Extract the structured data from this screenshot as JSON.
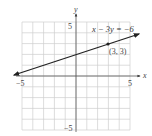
{
  "chart_data": {
    "type": "line",
    "title": "",
    "xlabel": "x",
    "ylabel": "y",
    "xlim": [
      -5,
      5
    ],
    "ylim": [
      -5,
      5
    ],
    "grid": true,
    "x_ticks_labeled": [
      "-5",
      "5"
    ],
    "y_ticks_labeled": [
      "5",
      "-5"
    ],
    "series": [
      {
        "name": "x - 3y = -6",
        "equation": "x − 3y = −6",
        "x": [
          -5.7,
          5.7
        ],
        "y": [
          0.1,
          3.9
        ],
        "arrows": "both"
      }
    ],
    "points": [
      {
        "x": 3,
        "y": 3,
        "label": "(3, 3)"
      }
    ],
    "annotations": [
      {
        "text": "x − 3y = −6",
        "x": 1.8,
        "y": 3.6
      }
    ]
  },
  "labels": {
    "x_axis": "x",
    "y_axis": "y",
    "x_min": "−5",
    "x_max": "5",
    "y_max": "5",
    "y_min": "−5",
    "equation": "x − 3y = −6",
    "point": "(3, 3)"
  }
}
